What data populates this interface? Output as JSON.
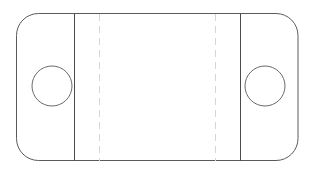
{
  "canvas": {
    "width": 315,
    "height": 172,
    "background_color": "#ffffff"
  },
  "drawing": {
    "title": "Device Outline Orthographic View",
    "type": "line-drawing",
    "outline": {
      "name": "rounded-rectangle-body",
      "shape": "rounded-rectangle",
      "x": 16.5,
      "y": 13.5,
      "width": 281.5,
      "height": 147,
      "corner_radius": 22,
      "stroke_color": "#5a5a5a",
      "stroke_width": 1,
      "fill": "none"
    },
    "solid_division_lines": [
      {
        "name": "left-division-line",
        "orientation": "vertical",
        "x": 74.5,
        "y1": 13.5,
        "y2": 160.5,
        "stroke_color": "#4a4a4a",
        "stroke_width": 1,
        "style": "solid"
      },
      {
        "name": "right-division-line",
        "orientation": "vertical",
        "x": 240.5,
        "y1": 13.5,
        "y2": 160.5,
        "stroke_color": "#4a4a4a",
        "stroke_width": 1,
        "style": "solid"
      }
    ],
    "dashed_center_lines": [
      {
        "name": "left-dashed-guide-line",
        "orientation": "vertical",
        "x": 99.5,
        "y1": 13.5,
        "y2": 160.5,
        "stroke_color": "#d6d6d6",
        "stroke_width": 1,
        "style": "dashed",
        "dash_pattern": "7 5"
      },
      {
        "name": "right-dashed-guide-line",
        "orientation": "vertical",
        "x": 215.5,
        "y1": 13.5,
        "y2": 160.5,
        "stroke_color": "#d6d6d6",
        "stroke_width": 1,
        "style": "dashed",
        "dash_pattern": "7 5"
      }
    ],
    "circles": [
      {
        "name": "left-circle-feature",
        "cx": 52,
        "cy": 86,
        "r": 20,
        "stroke_color": "#6a6a6a",
        "stroke_width": 1,
        "fill": "none"
      },
      {
        "name": "right-circle-feature",
        "cx": 265,
        "cy": 86,
        "r": 20,
        "stroke_color": "#6a6a6a",
        "stroke_width": 1,
        "fill": "none"
      }
    ]
  }
}
